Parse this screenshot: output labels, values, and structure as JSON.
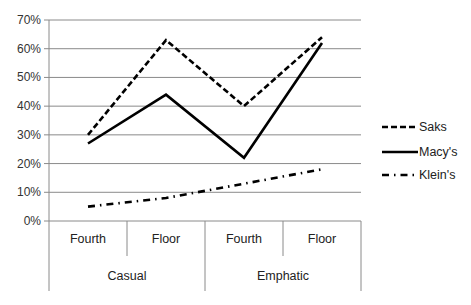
{
  "chart_data": {
    "type": "line",
    "title": "",
    "xlabel": "",
    "ylabel": "",
    "ylim": [
      0,
      0.7
    ],
    "y_ticks": [
      "0%",
      "10%",
      "20%",
      "30%",
      "40%",
      "50%",
      "60%",
      "70%"
    ],
    "grid": true,
    "legend_position": "right",
    "categories": [
      "Fourth",
      "Floor",
      "Fourth",
      "Floor"
    ],
    "category_groups": [
      {
        "label": "Casual",
        "span": 2
      },
      {
        "label": "Emphatic",
        "span": 2
      }
    ],
    "series": [
      {
        "name": "Saks",
        "style": "dashed",
        "values": [
          0.3,
          0.63,
          0.4,
          0.64
        ]
      },
      {
        "name": "Macy's",
        "style": "solid",
        "values": [
          0.27,
          0.44,
          0.22,
          0.62
        ]
      },
      {
        "name": "Klein's",
        "style": "dash-dot",
        "values": [
          0.05,
          0.08,
          0.13,
          0.18
        ]
      }
    ]
  },
  "legend": {
    "saks": "Saks",
    "macys": "Macy's",
    "kleins": "Klein's"
  },
  "axis": {
    "y_labels": [
      "0%",
      "10%",
      "20%",
      "30%",
      "40%",
      "50%",
      "60%",
      "70%"
    ]
  },
  "x_axis": {
    "level1": [
      "Fourth",
      "Floor",
      "Fourth",
      "Floor"
    ],
    "level2": [
      "Casual",
      "Emphatic"
    ]
  }
}
